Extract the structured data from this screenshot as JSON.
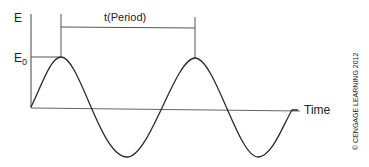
{
  "diagram": {
    "y_axis_label": "E",
    "amplitude_label_main": "E",
    "amplitude_label_sub": "0",
    "period_label": "t(Period)",
    "x_axis_label": "Time",
    "copyright": "© CENGAGE LEARNING 2012",
    "colors": {
      "line": "#2a2a2a",
      "text": "#222222",
      "guide": "#555555"
    }
  }
}
